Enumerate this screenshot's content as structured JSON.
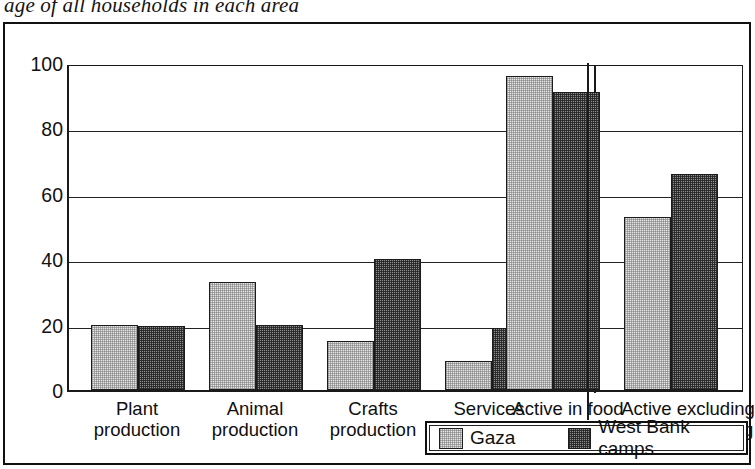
{
  "caption": "age of all households in each area",
  "legend": {
    "items": [
      {
        "label": "Gaza",
        "icon": "legend-swatch-light",
        "color": "#e6e6e6"
      },
      {
        "label": "West Bank camps",
        "icon": "legend-swatch-dark",
        "color": "#8e8e8e"
      }
    ]
  },
  "axis": {
    "y_ticks": [
      "0",
      "20",
      "40",
      "60",
      "80",
      "100"
    ]
  },
  "categories_display": [
    {
      "line1": "Plant",
      "line2": "production"
    },
    {
      "line1": "Animal",
      "line2": "production"
    },
    {
      "line1": "Crafts",
      "line2": "production"
    },
    {
      "line1": "Services",
      "line2": "and trade"
    },
    {
      "line1": "Active in food",
      "line2": "production"
    },
    {
      "line1": "Active excluding",
      "line2": "food processing"
    }
  ],
  "chart_data": {
    "type": "bar",
    "title": "age of all households in each area",
    "xlabel": "",
    "ylabel": "",
    "ylim": [
      0,
      100
    ],
    "yticks": [
      0,
      20,
      40,
      60,
      80,
      100
    ],
    "grid": true,
    "legend_position": "bottom-right",
    "categories": [
      "Plant production",
      "Animal production",
      "Crafts production",
      "Services and trade",
      "Active in food production",
      "Active excluding food processing"
    ],
    "series": [
      {
        "name": "Gaza",
        "color": "#e6e6e6",
        "values": [
          20,
          33,
          15,
          9,
          96,
          53
        ]
      },
      {
        "name": "West Bank camps",
        "color": "#8e8e8e",
        "values": [
          19.5,
          20,
          40,
          19,
          91,
          66
        ]
      }
    ],
    "annotations": [
      "vertical divider separating the last category group"
    ]
  }
}
